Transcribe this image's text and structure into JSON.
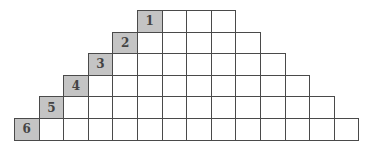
{
  "diagram": {
    "type": "staircase-grid",
    "rows": [
      {
        "label": "1",
        "cells": 4
      },
      {
        "label": "2",
        "cells": 6
      },
      {
        "label": "3",
        "cells": 8
      },
      {
        "label": "4",
        "cells": 10
      },
      {
        "label": "5",
        "cells": 12
      },
      {
        "label": "6",
        "cells": 14
      }
    ],
    "colors": {
      "label_fill": "#c4c4c4",
      "cell_fill": "#ffffff",
      "border": "#4a4a4a",
      "text": "#444444"
    }
  }
}
